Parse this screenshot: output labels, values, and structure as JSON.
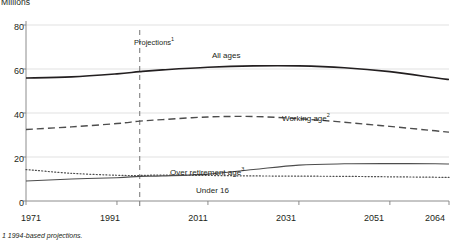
{
  "chart_data": {
    "type": "line",
    "title": "Millions",
    "xlabel": "",
    "ylabel": "Millions",
    "xlim": [
      1971,
      2064
    ],
    "ylim": [
      0,
      80
    ],
    "grid": true,
    "legend_position": "inline-annotations",
    "x_ticks": [
      "1971",
      "1991",
      "2011",
      "2031",
      "2051",
      "2064"
    ],
    "x_tick_values": [
      1971,
      1991,
      2011,
      2031,
      2051,
      2064
    ],
    "y_ticks": [
      "0",
      "20",
      "40",
      "60",
      "80"
    ],
    "y_tick_values": [
      0,
      20,
      40,
      60,
      80
    ],
    "x": [
      1971,
      1981,
      1991,
      1996,
      2001,
      2011,
      2021,
      2031,
      2041,
      2051,
      2061,
      2064
    ],
    "series": [
      {
        "name": "All ages",
        "style": "solid",
        "color": "#231f20",
        "width": 1.6,
        "values": [
          55.9,
          56.4,
          57.8,
          58.8,
          59.6,
          60.8,
          61.4,
          61.4,
          60.6,
          58.8,
          56.0,
          55.2
        ]
      },
      {
        "name": "Working age",
        "style": "dashed",
        "color": "#4d4d4d",
        "width": 1.4,
        "values": [
          32.5,
          33.7,
          35.2,
          36.3,
          37.0,
          38.2,
          38.4,
          37.4,
          35.8,
          33.9,
          31.9,
          31.3
        ]
      },
      {
        "name": "Over retirement age",
        "style": "solid",
        "color": "#4d4d4d",
        "width": 1.1,
        "values": [
          9.1,
          10.0,
          10.6,
          11.2,
          11.4,
          12.2,
          14.3,
          16.3,
          16.9,
          17.0,
          16.9,
          16.8
        ]
      },
      {
        "name": "Under 16",
        "style": "dotted",
        "color": "#4d4d4d",
        "width": 1.2,
        "values": [
          14.3,
          12.6,
          11.7,
          11.6,
          11.8,
          11.6,
          11.4,
          11.3,
          11.2,
          11.0,
          10.8,
          10.7
        ]
      }
    ],
    "annotations": [
      {
        "name": "projection-divider",
        "label": "Projections",
        "superscript": "1",
        "x": 1996,
        "type": "vertical-dashed-line"
      }
    ],
    "series_label_superscripts": {
      "All ages": "",
      "Working age": "2",
      "Over retirement age": "3",
      "Under 16": ""
    },
    "footnote": "1  1994-based projections."
  },
  "labels": {
    "axis_title": "Millions",
    "projections": "Projections",
    "projections_sup": "1",
    "all_ages": "All ages",
    "working_age": "Working age",
    "working_age_sup": "2",
    "over_retirement_age": "Over retirement age",
    "over_retirement_age_sup": "3",
    "under_16": "Under 16",
    "footnote": "1  1994-based projections.",
    "y0": "0",
    "y20": "20",
    "y40": "40",
    "y60": "60",
    "y80": "80",
    "x1971": "1971",
    "x1991": "1991",
    "x2011": "2011",
    "x2031": "2031",
    "x2051": "2051",
    "x2064": "2064"
  }
}
